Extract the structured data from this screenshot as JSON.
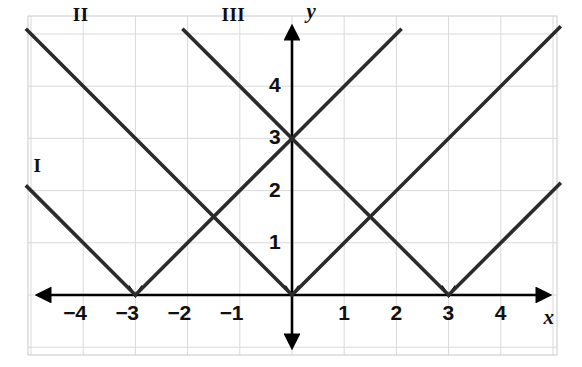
{
  "chart_data": {
    "type": "line",
    "title": "",
    "subtitle": "",
    "xlabel": "x",
    "ylabel": "y",
    "xlim": [
      -5.1,
      5.2
    ],
    "ylim": [
      -1.35,
      5.7
    ],
    "grid": true,
    "grid_spacing": 1,
    "legend": "inline-labels",
    "x_ticks": [
      -4,
      -3,
      -2,
      -1,
      1,
      2,
      3,
      4
    ],
    "x_tick_labels": [
      "−4",
      "−3",
      "−2",
      "−1",
      "1",
      "2",
      "3",
      "4"
    ],
    "y_ticks": [
      1,
      2,
      3,
      4
    ],
    "y_tick_labels": [
      "1",
      "2",
      "3",
      "4"
    ],
    "origin_label": "",
    "series": [
      {
        "name": "I",
        "label": "I",
        "equation": "y = |x + 3|",
        "vertex": [
          -3,
          0
        ],
        "slope_left": -1,
        "slope_right": 1,
        "points": [
          [
            -5.1,
            2.1
          ],
          [
            -3,
            0
          ],
          [
            0,
            3
          ],
          [
            2.1,
            5.1
          ]
        ]
      },
      {
        "name": "II",
        "label": "II",
        "equation": "y = |x|",
        "vertex": [
          0,
          0
        ],
        "slope_left": -1,
        "slope_right": 1,
        "points": [
          [
            -5.1,
            5.1
          ],
          [
            0,
            0
          ],
          [
            5.15,
            5.15
          ]
        ]
      },
      {
        "name": "III",
        "label": "III",
        "equation": "y = |x − 3|",
        "vertex": [
          3,
          0
        ],
        "slope_left": -1,
        "slope_right": 1,
        "points": [
          [
            -2.1,
            5.1
          ],
          [
            0,
            3
          ],
          [
            3,
            0
          ],
          [
            5.15,
            2.15
          ]
        ]
      }
    ],
    "annotations": [
      {
        "text": "I",
        "x": -4.95,
        "y": 2.45
      },
      {
        "text": "II",
        "x": -4.2,
        "y": 5.35
      },
      {
        "text": "III",
        "x": -1.35,
        "y": 5.35
      },
      {
        "text": "y",
        "x": 0.28,
        "y": 5.45
      },
      {
        "text": "x",
        "x": 4.82,
        "y": -0.42
      }
    ],
    "intersections": [
      [
        0,
        3
      ],
      [
        -1.5,
        1.5
      ],
      [
        1.5,
        1.5
      ]
    ]
  },
  "style": {
    "curve_color": "#2b2b2b",
    "axis_color": "#000000",
    "grid_color": "#d9d9d9",
    "border_color": "#c9c9c9",
    "background": "#ffffff",
    "label_color": "#101010"
  }
}
